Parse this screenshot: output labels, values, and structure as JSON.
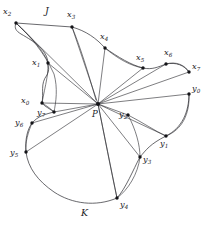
{
  "figure": {
    "type": "planar-graph-diagram",
    "background_color": "#ffffff",
    "line_color": "#2e2e33",
    "vertex_color": "#141418",
    "label_color": "#1b1b1f",
    "hub": {
      "name": "P",
      "label": "P",
      "x": 98,
      "y": 104,
      "label_x": 92,
      "label_y": 110
    },
    "region_labels": [
      {
        "name": "region-j",
        "label": "J",
        "x": 45,
        "y": 6
      },
      {
        "name": "region-k",
        "label": "K",
        "x": 81,
        "y": 208
      }
    ],
    "vertices": [
      {
        "name": "x0",
        "base": "x",
        "sub": "0",
        "x": 42,
        "y": 103,
        "label_x": 21,
        "label_y": 96
      },
      {
        "name": "x1",
        "base": "x",
        "sub": "1",
        "x": 48,
        "y": 63,
        "label_x": 32,
        "label_y": 58
      },
      {
        "name": "x2",
        "base": "x",
        "sub": "2",
        "x": 16,
        "y": 23,
        "label_x": 3,
        "label_y": 7
      },
      {
        "name": "x3",
        "base": "x",
        "sub": "3",
        "x": 72,
        "y": 27,
        "label_x": 67,
        "label_y": 10
      },
      {
        "name": "x4",
        "base": "x",
        "sub": "4",
        "x": 105,
        "y": 48,
        "label_x": 100,
        "label_y": 32
      },
      {
        "name": "x5",
        "base": "x",
        "sub": "5",
        "x": 143,
        "y": 68,
        "label_x": 136,
        "label_y": 53
      },
      {
        "name": "x6",
        "base": "x",
        "sub": "6",
        "x": 166,
        "y": 64,
        "label_x": 164,
        "label_y": 48
      },
      {
        "name": "x7",
        "base": "x",
        "sub": "7",
        "x": 189,
        "y": 72,
        "label_x": 192,
        "label_y": 62
      },
      {
        "name": "y0",
        "base": "y",
        "sub": "0",
        "x": 189,
        "y": 94,
        "label_x": 192,
        "label_y": 84
      },
      {
        "name": "y1",
        "base": "y",
        "sub": "1",
        "x": 166,
        "y": 136,
        "label_x": 160,
        "label_y": 139
      },
      {
        "name": "y2",
        "base": "y",
        "sub": "2",
        "x": 128,
        "y": 115,
        "label_x": 119,
        "label_y": 110
      },
      {
        "name": "y3",
        "base": "y",
        "sub": "3",
        "x": 140,
        "y": 157,
        "label_x": 143,
        "label_y": 155
      },
      {
        "name": "y4",
        "base": "y",
        "sub": "4",
        "x": 117,
        "y": 198,
        "label_x": 120,
        "label_y": 200
      },
      {
        "name": "y5",
        "base": "y",
        "sub": "5",
        "x": 26,
        "y": 152,
        "label_x": 10,
        "label_y": 148
      },
      {
        "name": "y6",
        "base": "y",
        "sub": "6",
        "x": 32,
        "y": 123,
        "label_x": 15,
        "label_y": 118
      },
      {
        "name": "y7",
        "base": "y",
        "sub": "7",
        "x": 54,
        "y": 112,
        "label_x": 37,
        "label_y": 108
      }
    ],
    "chords_from_hub": [
      "x0",
      "x1",
      "x2",
      "x3",
      "x4",
      "x5",
      "x6",
      "x7",
      "y0",
      "y1",
      "y2",
      "y3",
      "y4",
      "y5",
      "y6",
      "y7"
    ],
    "boundary_j": "M 42,103 C 44,92 40,84 47,75 C 50,69 48,66 48,63 C 47,50 35,42 21,34 C 16,31 14,28 16,23 L 72,27 C 86,31 96,38 105,48 C 118,57 131,65 143,68 C 152,70 158,67 166,64 C 176,62 184,65 189,72",
    "boundary_k": "M 189,94 C 189,112 182,128 166,136 C 150,144 146,150 140,157 C 133,170 126,188 117,198 C 96,207 72,204 54,192 C 38,181 28,168 26,152 C 25,140 27,130 32,123 C 38,116 46,114 54,112 C 47,107 44,106 42,103",
    "inner_curves": [
      {
        "name": "curve-x2-x0",
        "d": "M 16,23 C 28,34 40,46 47,60 C 50,70 45,86 42,103"
      },
      {
        "name": "curve-x2-y7-inner",
        "d": "M 16,23 C 30,36 44,52 54,74 C 58,88 56,102 54,112"
      },
      {
        "name": "curve-x3-hub",
        "d": "M 72,27 C 80,46 88,72 96,100"
      },
      {
        "name": "curve-x4-x5-arc",
        "d": "M 105,48 C 118,59 131,66 143,68"
      },
      {
        "name": "curve-x6-x7-arc",
        "d": "M 166,64 C 176,61 185,65 189,72"
      },
      {
        "name": "curve-y0-y1-arc",
        "d": "M 189,94 C 190,114 182,130 166,136"
      },
      {
        "name": "curve-y2-y1",
        "d": "M 128,115 C 142,122 155,131 166,136"
      },
      {
        "name": "curve-y2-y3-y4",
        "d": "M 128,115 C 136,130 140,145 140,157 C 138,174 128,190 117,198"
      },
      {
        "name": "curve-hub-y4",
        "d": "M 98,104 C 104,134 111,170 117,198"
      },
      {
        "name": "curve-y6-y5",
        "d": "M 32,123 C 28,133 25,142 26,152"
      },
      {
        "name": "curve-x0-y7-link",
        "d": "M 42,103 C 47,106 51,109 54,112"
      }
    ]
  }
}
